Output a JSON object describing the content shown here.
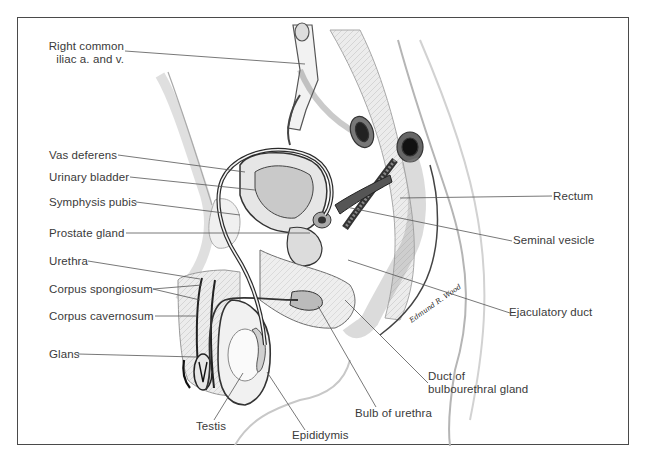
{
  "figure": {
    "signature": "Edmund R. Wood",
    "colors": {
      "border": "#4a4a4a",
      "label_text": "#3a3a3a",
      "leader": "#555555",
      "shading": "#bdbdbd",
      "outline": "#2e2e2e"
    }
  },
  "labels": {
    "iliac": {
      "line1": "Right common",
      "line2": "iliac a. and v."
    },
    "vas_deferens": "Vas deferens",
    "urinary_bladder": "Urinary bladder",
    "symphysis_pubis": "Symphysis pubis",
    "prostate_gland": "Prostate gland",
    "urethra": "Urethra",
    "corpus_spongiosum": "Corpus spongiosum",
    "corpus_cavernosum": "Corpus cavernosum",
    "glans": "Glans",
    "testis": "Testis",
    "epididymis": "Epididymis",
    "bulb_of_urethra": "Bulb of urethra",
    "duct_bulbourethral": {
      "line1": "Duct of",
      "line2": "bulbourethral gland"
    },
    "ejaculatory_duct": "Ejaculatory duct",
    "seminal_vesicle": "Seminal vesicle",
    "rectum": "Rectum"
  }
}
